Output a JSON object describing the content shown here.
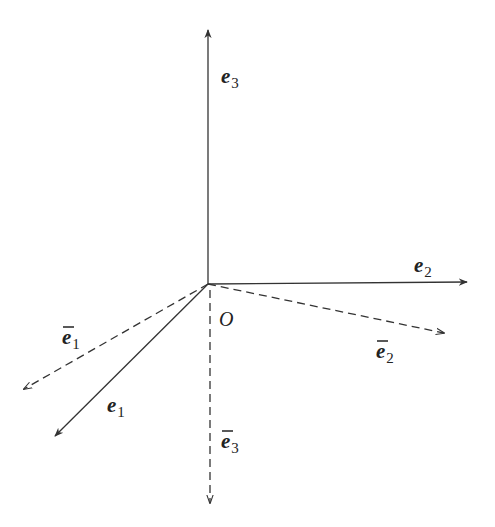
{
  "diagram": {
    "origin": {
      "label": "O",
      "x": 208,
      "y": 284
    },
    "stroke_color": "#333333",
    "vectors": [
      {
        "id": "e3",
        "name": "e",
        "sub": "3",
        "bar": false,
        "style": "solid",
        "tip": [
          208,
          30
        ],
        "label_pos": [
          221,
          83
        ]
      },
      {
        "id": "e2",
        "name": "e",
        "sub": "2",
        "bar": false,
        "style": "solid",
        "tip": [
          467,
          282
        ],
        "label_pos": [
          414,
          272
        ]
      },
      {
        "id": "e1",
        "name": "e",
        "sub": "1",
        "bar": false,
        "style": "solid",
        "tip": [
          55,
          436
        ],
        "label_pos": [
          107,
          412
        ]
      },
      {
        "id": "e1bar",
        "name": "e",
        "sub": "1",
        "bar": true,
        "style": "dashed",
        "tip": [
          24,
          389
        ],
        "label_pos": [
          62,
          344
        ]
      },
      {
        "id": "e2bar",
        "name": "e",
        "sub": "2",
        "bar": true,
        "style": "dashed",
        "tip": [
          444,
          333
        ],
        "label_pos": [
          376,
          358
        ]
      },
      {
        "id": "e3bar",
        "name": "e",
        "sub": "3",
        "bar": true,
        "style": "dashed",
        "tip": [
          210,
          503
        ],
        "label_pos": [
          221,
          448
        ]
      }
    ]
  }
}
